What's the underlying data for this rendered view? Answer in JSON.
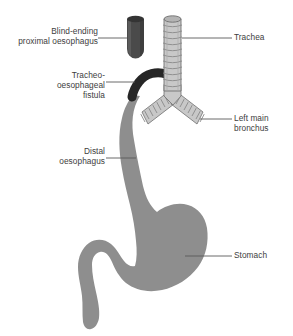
{
  "figure": {
    "background_color": "#ffffff"
  },
  "colors": {
    "pouch_dark": "#4a4a4a",
    "pouch_rim": "#343434",
    "trachea_light": "#c8c8c8",
    "trachea_ring": "#8a8a8a",
    "trachea_outline": "#6f6f6f",
    "fistula_dark": "#262626",
    "oesophagus_gray": "#8e8e8e",
    "stomach_gray": "#8e8e8e",
    "leader_line": "#5a5a5a",
    "text": "#3d3d3d"
  },
  "labels": {
    "blind_ending": "Blind-ending\nproximal oesophagus",
    "fistula": "Tracheo-\noesophageal\nfistula",
    "distal": "Distal\noesophagus",
    "trachea": "Trachea",
    "bronchus": "Left main\nbronchus",
    "stomach": "Stomach"
  },
  "structures": [
    {
      "name": "blind-ending-proximal-oesophagus",
      "label": "Blind-ending proximal oesophagus",
      "fill": "#4a4a4a",
      "description": "Dark closed-end tube, upper left of midline"
    },
    {
      "name": "trachea",
      "label": "Trachea",
      "fill": "#c8c8c8",
      "rings": 11,
      "description": "Light grey ribbed tube descending from top centre"
    },
    {
      "name": "tracheo-oesophageal-fistula",
      "label": "Tracheo-oesophageal fistula",
      "fill": "#262626",
      "description": "Dark curved connection from lower trachea to distal oesophagus"
    },
    {
      "name": "left-main-bronchus",
      "label": "Left main bronchus",
      "fill": "#c8c8c8",
      "rings": 9,
      "description": "Ribbed branch angling down and to the right of the carina"
    },
    {
      "name": "right-main-bronchus",
      "label": "Right main bronchus",
      "fill": "#c8c8c8",
      "rings": 9,
      "description": "Ribbed branch angling down and to the left of the carina"
    },
    {
      "name": "distal-oesophagus",
      "label": "Distal oesophagus",
      "fill": "#8e8e8e",
      "description": "Grey tube curving down from the fistula to the stomach"
    },
    {
      "name": "stomach",
      "label": "Stomach",
      "fill": "#8e8e8e",
      "description": "Large grey organ with duodenum curving to lower left"
    }
  ],
  "leader_lines": [
    {
      "name": "leader-blind-ending",
      "from_x": 98,
      "from_y": 38,
      "to_x": 127,
      "to_y": 38
    },
    {
      "name": "leader-fistula",
      "from_x": 106,
      "from_y": 82,
      "to_x": 134,
      "to_y": 82
    },
    {
      "name": "leader-distal",
      "from_x": 106,
      "from_y": 158,
      "to_x": 135,
      "to_y": 158
    },
    {
      "name": "leader-trachea",
      "from_x": 193,
      "from_y": 38,
      "to_x": 232,
      "to_y": 38
    },
    {
      "name": "leader-bronchus",
      "from_x": 206,
      "from_y": 119,
      "to_x": 232,
      "to_y": 119
    },
    {
      "name": "leader-stomach",
      "from_x": 191,
      "from_y": 256,
      "to_x": 232,
      "to_y": 256
    }
  ]
}
